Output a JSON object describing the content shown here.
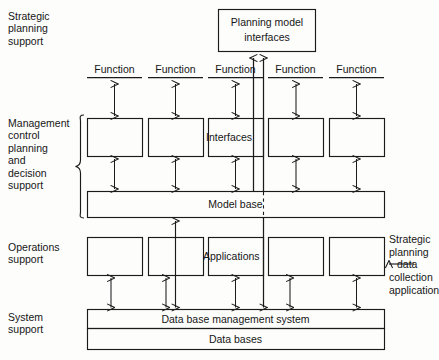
{
  "figure": {
    "type": "layered-architecture-block-diagram",
    "title": "",
    "ink_color": "#1b1b1b",
    "background_color": "#fdfdfc"
  },
  "tiers": [
    {
      "id": "strategic",
      "label": "Strategic\nplanning\nsupport"
    },
    {
      "id": "management",
      "label": "Management\ncontrol\nplanning\nand\ndecision\nsupport"
    },
    {
      "id": "operations",
      "label": "Operations\nsupport"
    },
    {
      "id": "system",
      "label": "System\nsupport"
    }
  ],
  "top_box": {
    "label": "Planning model\ninterfaces",
    "line1": "Planning model",
    "line2": "interfaces"
  },
  "function_headers": [
    {
      "label": "Function"
    },
    {
      "label": "Function"
    },
    {
      "label": "Function"
    },
    {
      "label": "Function"
    },
    {
      "label": "Function"
    }
  ],
  "interface_row": {
    "callout_label": "Interfaces",
    "boxes": [
      "",
      "",
      "",
      "",
      ""
    ]
  },
  "application_row": {
    "callout_label": "Applications",
    "boxes": [
      "",
      "",
      "",
      "",
      ""
    ]
  },
  "bands": [
    {
      "id": "model-base",
      "label": "Model base"
    },
    {
      "id": "dbms",
      "label": "Data base management system"
    },
    {
      "id": "databases",
      "label": "Data bases"
    }
  ],
  "annotation": {
    "label": "Strategic\nplanning\ndata\ncollection\napplication",
    "line1": "Strategic",
    "line2": "planning",
    "line3": "data",
    "line4": "collection",
    "line5": "application",
    "arrow": "left-arrow-icon"
  }
}
